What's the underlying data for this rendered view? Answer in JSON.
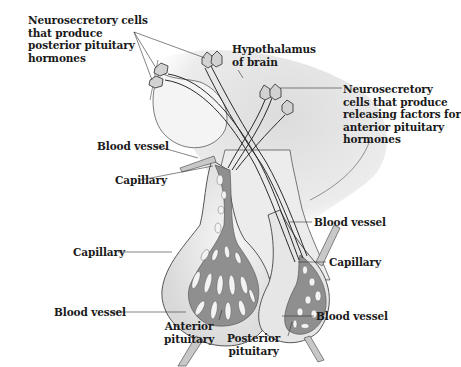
{
  "colors": {
    "background": "#ffffff",
    "tissue_light": "#ececec",
    "tissue_mid": "#d6d6d6",
    "vessel": "#9a9a9a",
    "outline": "#3a3a3a",
    "text": "#1a1a1a"
  },
  "labels": {
    "neuro_posterior": "Neurosecretory cells\nthat produce\nposterior pituitary\nhormones",
    "hypothalamus": "Hypothalamus\nof brain",
    "neuro_anterior": "Neurosecretory\ncells that produce\nreleasing factors for\nanterior pituitary\nhormones",
    "blood_vessel_upper_left": "Blood vessel",
    "capillary_upper_left": "Capillary",
    "capillary_left": "Capillary",
    "blood_vessel_lower_left": "Blood vessel",
    "anterior_pituitary": "Anterior\npituitary",
    "posterior_pituitary": "Posterior\npituitary",
    "blood_vessel_upper_right": "Blood vessel",
    "capillary_right": "Capillary",
    "blood_vessel_lower_right": "Blood vessel"
  }
}
